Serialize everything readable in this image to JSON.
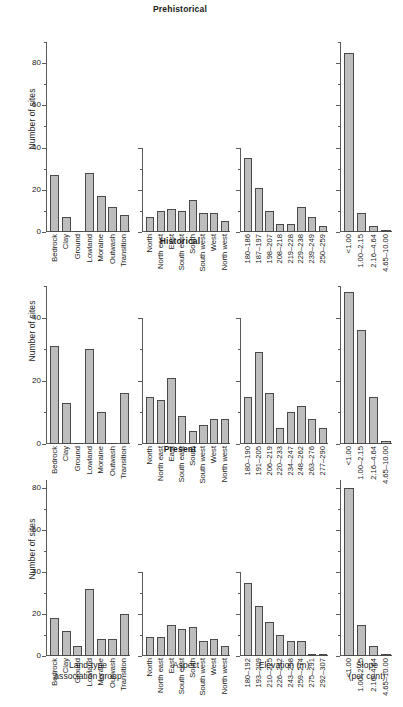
{
  "figure": {
    "ylabel": "Number of sites",
    "group_labels": [
      {
        "line1": "Land-type",
        "line2": "association group"
      },
      {
        "line1": "Aspect",
        "line2": ""
      },
      {
        "line1": "Elevation (m)",
        "line2": ""
      },
      {
        "line1": "Slope",
        "line2": "(per cent)"
      }
    ]
  },
  "chart_data": [
    {
      "type": "bar",
      "title": "Prehistorical",
      "ylabel": "Number of sites",
      "ylim": [
        0,
        90
      ],
      "yticks": [
        0,
        20,
        40,
        60,
        80
      ],
      "yticklabels": [
        "0",
        "20",
        "40",
        "60",
        "80"
      ],
      "grid": false,
      "groups": [
        {
          "xlabel": "Land-type association group",
          "categories": [
            "Bedrock",
            "Clay",
            "Ground",
            "Lowland",
            "Moraine",
            "Outwash",
            "Transition"
          ],
          "values": [
            27,
            7,
            0,
            28,
            17,
            12,
            8
          ]
        },
        {
          "xlabel": "Aspect",
          "categories": [
            "North",
            "North east",
            "East",
            "South east",
            "South",
            "South west",
            "West",
            "North west"
          ],
          "values": [
            7,
            10,
            11,
            10,
            15,
            9,
            9,
            5
          ]
        },
        {
          "xlabel": "Elevation (m)",
          "categories": [
            "180–186",
            "187–197",
            "198–207",
            "208–218",
            "219–228",
            "229–238",
            "239–249",
            "250–259"
          ],
          "values": [
            35,
            21,
            10,
            4,
            4,
            12,
            7,
            3
          ]
        },
        {
          "xlabel": "Slope (per cent)",
          "categories": [
            "<1.00",
            "1.00–2.15",
            "2.16–4.64",
            "4.65–10.00"
          ],
          "values": [
            85,
            9,
            3,
            1
          ]
        }
      ]
    },
    {
      "type": "bar",
      "title": "Historical",
      "ylabel": "Number of sites",
      "ylim": [
        0,
        50
      ],
      "yticks": [
        0,
        20,
        40
      ],
      "yticklabels": [
        "0",
        "20",
        "40"
      ],
      "grid": false,
      "groups": [
        {
          "xlabel": "Land-type association group",
          "categories": [
            "Bedrock",
            "Clay",
            "Ground",
            "Lowland",
            "Moraine",
            "Outwash",
            "Transition"
          ],
          "values": [
            31,
            13,
            0,
            30,
            10,
            0,
            16
          ]
        },
        {
          "xlabel": "Aspect",
          "categories": [
            "North",
            "North east",
            "East",
            "South east",
            "South",
            "South west",
            "West",
            "North west"
          ],
          "values": [
            15,
            14,
            21,
            9,
            4,
            6,
            8,
            8
          ]
        },
        {
          "xlabel": "Elevation (m)",
          "categories": [
            "180–190",
            "191–205",
            "206–219",
            "220–233",
            "234–247",
            "248–262",
            "263–276",
            "277–290"
          ],
          "values": [
            15,
            29,
            16,
            5,
            10,
            12,
            8,
            5
          ]
        },
        {
          "xlabel": "Slope (per cent)",
          "categories": [
            "<1.00",
            "1.00–2.15",
            "2.16–4.64",
            "4.65–10.00"
          ],
          "values": [
            48,
            36,
            15,
            1
          ]
        }
      ]
    },
    {
      "type": "bar",
      "title": "Present",
      "ylabel": "Number of sites",
      "ylim": [
        0,
        84
      ],
      "yticks": [
        0,
        20,
        40,
        60,
        80
      ],
      "yticklabels": [
        "0",
        "20",
        "40",
        "60",
        "80"
      ],
      "grid": false,
      "groups": [
        {
          "xlabel": "Land-type association group",
          "categories": [
            "Bedrock",
            "Clay",
            "Ground",
            "Lowland",
            "Moraine",
            "Outwash",
            "Transition"
          ],
          "values": [
            18,
            12,
            5,
            32,
            8,
            8,
            20
          ]
        },
        {
          "xlabel": "Aspect",
          "categories": [
            "North",
            "North east",
            "East",
            "South east",
            "South",
            "South west",
            "West",
            "North west"
          ],
          "values": [
            9,
            9,
            15,
            13,
            14,
            7,
            8,
            5
          ]
        },
        {
          "xlabel": "Elevation (m)",
          "categories": [
            "180–192",
            "193–209",
            "210–225",
            "226–242",
            "243–258",
            "259–274",
            "275–291",
            "292–307"
          ],
          "values": [
            35,
            24,
            16,
            10,
            7,
            7,
            1,
            1
          ]
        },
        {
          "xlabel": "Slope (per cent)",
          "categories": [
            "<1.00",
            "1.00–2.15",
            "2.16–4.64",
            "4.65–10.00"
          ],
          "values": [
            80,
            15,
            5,
            1
          ]
        }
      ]
    }
  ]
}
